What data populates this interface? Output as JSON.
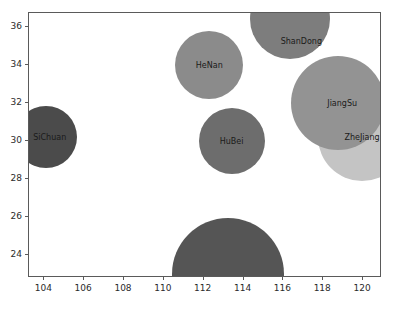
{
  "chart_data": {
    "type": "scatter",
    "title": "",
    "xlabel": "",
    "ylabel": "",
    "xlim": [
      103.23,
      120.95
    ],
    "ylim": [
      22.78,
      36.73
    ],
    "grid": false,
    "legend": null,
    "xticks": [
      104,
      106,
      108,
      110,
      112,
      114,
      116,
      118,
      120
    ],
    "yticks": [
      24,
      26,
      28,
      30,
      32,
      34,
      36
    ],
    "size_encoding": "bubble-radius",
    "points": [
      {
        "label": "SiChuan",
        "x": 104.07,
        "y": 30.2,
        "radius_px": 31,
        "color": "#4b4b4b",
        "label_dx_px": 4,
        "label_dy_px": 0
      },
      {
        "label": "HeNan",
        "x": 112.28,
        "y": 34.0,
        "radius_px": 34,
        "color": "#8b8b8b",
        "label_dx_px": 0,
        "label_dy_px": 0
      },
      {
        "label": "ShanDong",
        "x": 116.35,
        "y": 36.4,
        "radius_px": 40,
        "color": "#7d7d7d",
        "label_dx_px": 11,
        "label_dy_px": 22
      },
      {
        "label": "HuBei",
        "x": 113.4,
        "y": 30.0,
        "radius_px": 33,
        "color": "#6d6d6d",
        "label_dx_px": 0,
        "label_dy_px": 0
      },
      {
        "label": "JiangSu",
        "x": 118.75,
        "y": 32.0,
        "radius_px": 47,
        "color": "#939393",
        "label_dx_px": 4,
        "label_dy_px": 0
      },
      {
        "label": "ZheJiang",
        "x": 119.95,
        "y": 30.2,
        "radius_px": 44,
        "color": "#c4c4c4",
        "label_dx_px": 0,
        "label_dy_px": 0
      },
      {
        "label": "GuangDong",
        "x": 113.2,
        "y": 23.0,
        "radius_px": 56,
        "color": "#555555",
        "label_dx_px": 16,
        "label_dy_px": 8
      }
    ]
  },
  "axes": {
    "spine_color": "#5a5a5a",
    "tick_color": "#2b2b2b",
    "background": "#ffffff"
  }
}
